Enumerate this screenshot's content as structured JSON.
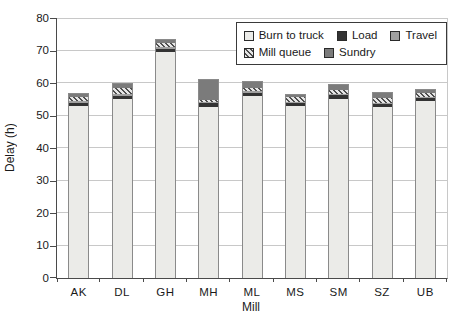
{
  "figure": {
    "width": 462,
    "height": 321
  },
  "colors": {
    "background": "#ffffff",
    "grid": "#c8c8c8",
    "axis": "#4a4a4a",
    "bar_border": "#8a8a8a",
    "text": "#1a1a1a"
  },
  "chart_data": {
    "type": "bar",
    "stacked": true,
    "title": "",
    "xlabel": "Mill",
    "ylabel": "Delay (h)",
    "ylim": [
      0,
      80
    ],
    "yticks": [
      0,
      10,
      20,
      30,
      40,
      50,
      60,
      70,
      80
    ],
    "grid": true,
    "categories": [
      "AK",
      "DL",
      "GH",
      "MH",
      "ML",
      "MS",
      "SM",
      "SZ",
      "UB"
    ],
    "series": [
      {
        "name": "Burn to truck",
        "color": "#ebebe8",
        "values": [
          53.0,
          55.0,
          69.5,
          52.5,
          56.0,
          53.0,
          55.0,
          52.5,
          54.5
        ]
      },
      {
        "name": "Load",
        "color": "#333333",
        "values": [
          1.0,
          1.0,
          1.0,
          1.2,
          1.0,
          1.0,
          1.2,
          1.0,
          1.0
        ]
      },
      {
        "name": "Travel",
        "color": "#a0a0a0",
        "values": [
          0.4,
          0.5,
          0.5,
          0.5,
          0.4,
          0.3,
          0.4,
          0.4,
          0.3
        ]
      },
      {
        "name": "Mill queue",
        "color": "hatch",
        "values": [
          1.2,
          2.0,
          1.2,
          0.5,
          1.0,
          1.4,
          1.4,
          1.5,
          1.2
        ]
      },
      {
        "name": "Sundry",
        "color": "#7b7b7b",
        "values": [
          1.0,
          1.3,
          1.0,
          6.3,
          1.8,
          0.6,
          1.5,
          1.4,
          1.0
        ]
      }
    ],
    "totals": [
      56.6,
      59.8,
      73.2,
      61.0,
      60.2,
      56.3,
      59.5,
      56.8,
      58.0
    ],
    "legend": {
      "position": "top-right",
      "rows": [
        [
          "Burn to truck",
          "Load",
          "Travel"
        ],
        [
          "Mill queue",
          "Sundry"
        ]
      ]
    }
  }
}
